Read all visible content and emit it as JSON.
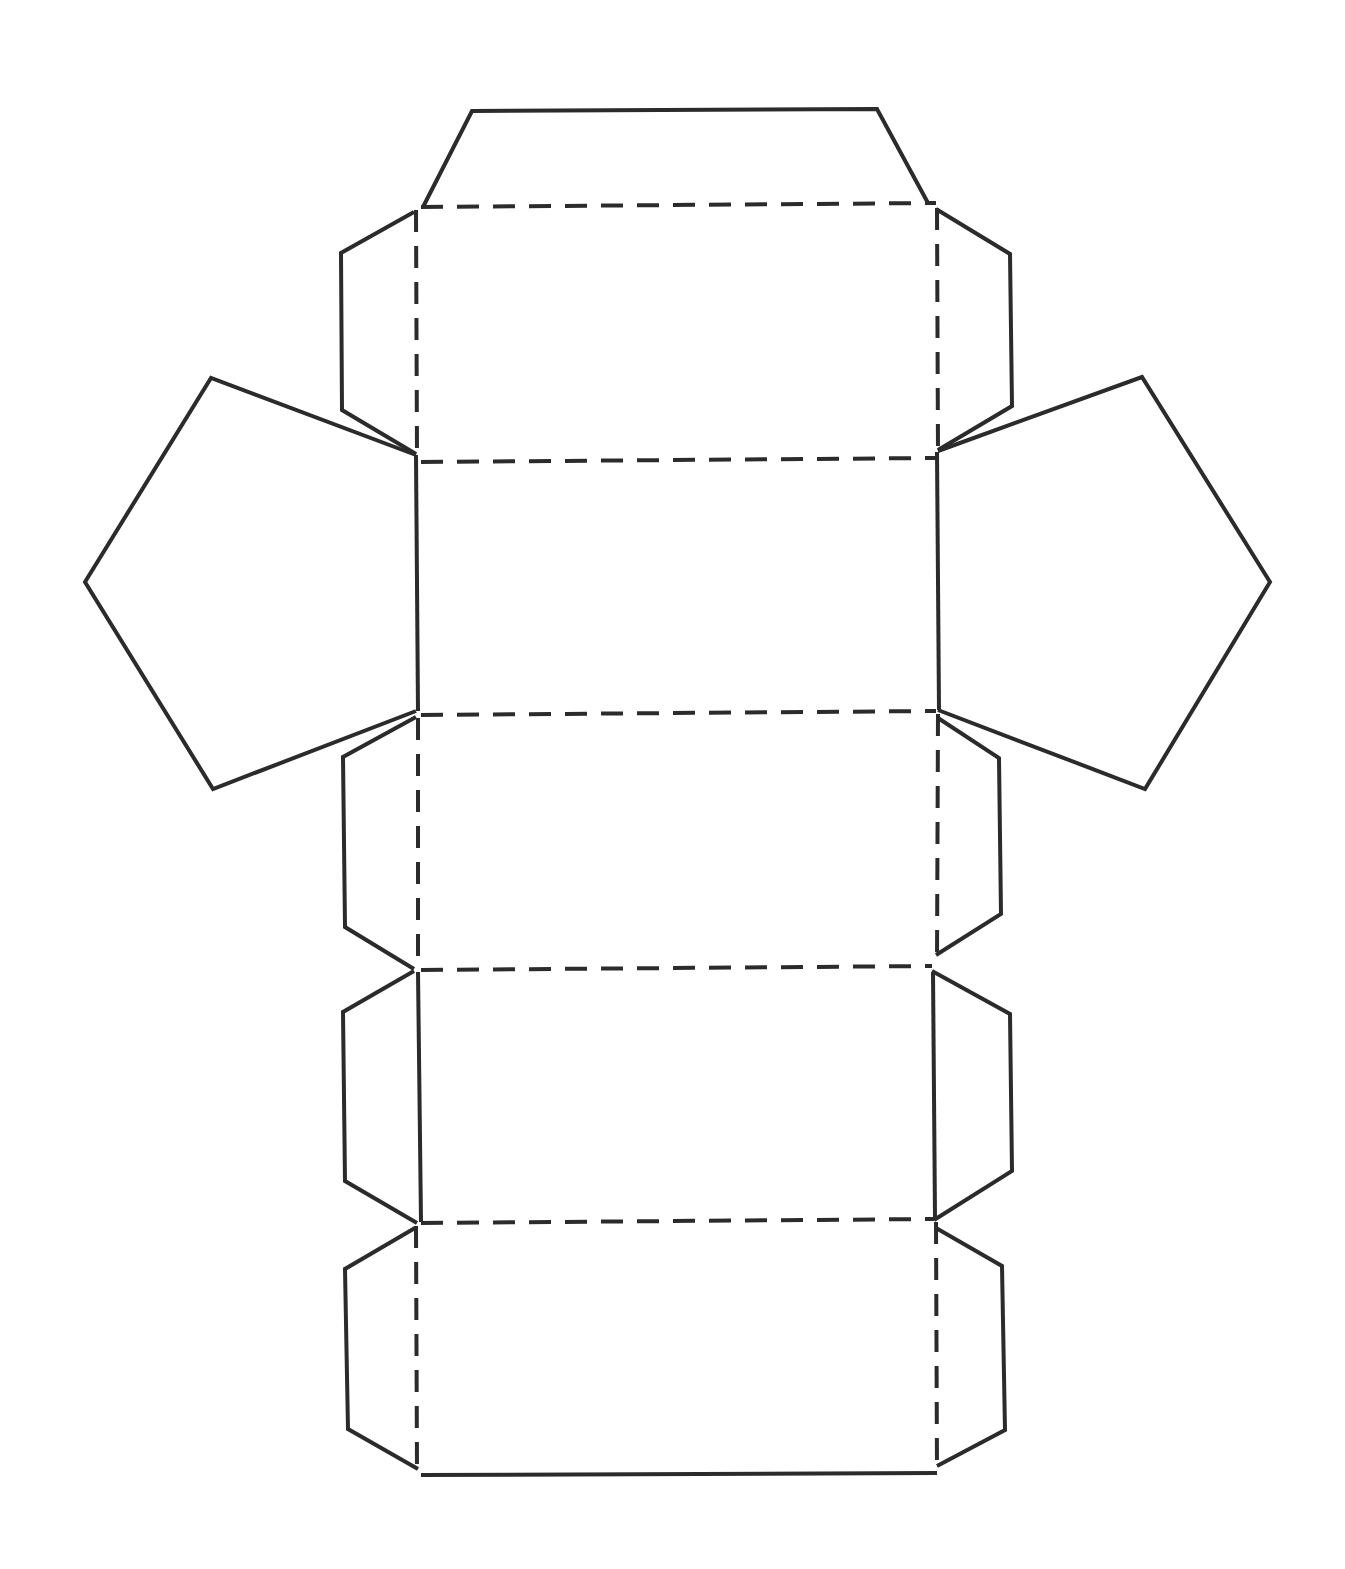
{
  "diagram": {
    "type": "net",
    "colors": {
      "line": "#2b2b2b",
      "background": "#ffffff"
    },
    "faces": {
      "rectangles": 5,
      "pentagons": 2,
      "glue_tabs": 9
    },
    "line_styles": {
      "cut": "solid",
      "fold": "dashed"
    }
  }
}
